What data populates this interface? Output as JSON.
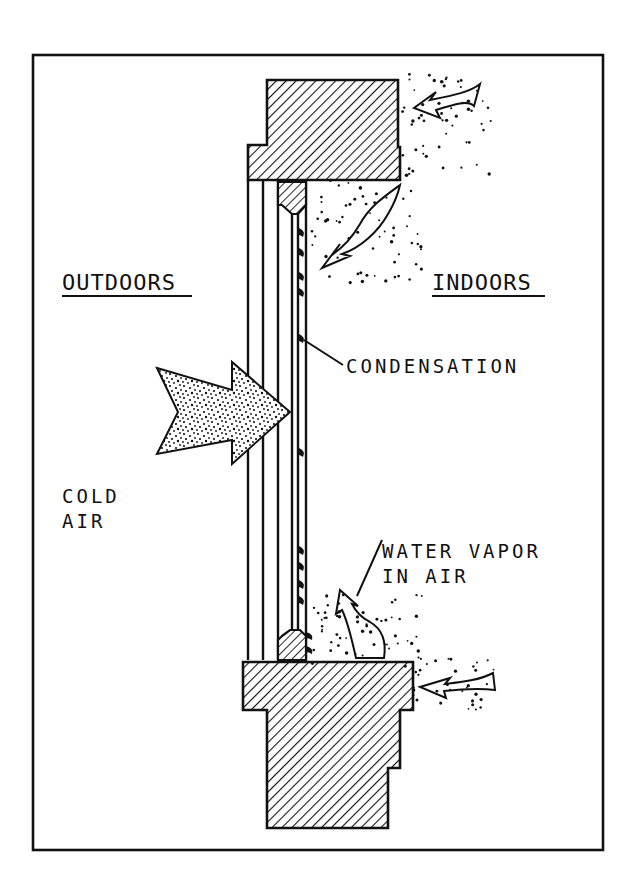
{
  "figure": {
    "type": "cross-section diagram",
    "labels": {
      "outdoors": "OUTDOORS",
      "indoors": "INDOORS",
      "condensation": "CONDENSATION",
      "cold_air_line1": "COLD",
      "cold_air_line2": "AIR",
      "water_vapor_line1": "WATER VAPOR",
      "water_vapor_line2": "IN AIR"
    },
    "elements": [
      {
        "name": "head-jamb",
        "description": "hatched wood head frame at top"
      },
      {
        "name": "sill",
        "description": "hatched wood sill at bottom"
      },
      {
        "name": "glazing",
        "description": "multiple parallel glass panes"
      },
      {
        "name": "sash-stops",
        "description": "small hatched blocks at top and bottom of inner pane"
      },
      {
        "name": "condensation-droplets",
        "description": "droplets on the inner glass surface"
      },
      {
        "name": "cold-air-arrow",
        "description": "speckled double arrow from outdoors pointing at glass"
      },
      {
        "name": "indoor-air-arrows",
        "description": "outlined curved arrows showing moist indoor air circulating"
      },
      {
        "name": "water-vapor-dots",
        "description": "stippled dots representing water vapor"
      }
    ],
    "colors": {
      "ink": "#111111",
      "background": "#ffffff"
    }
  }
}
